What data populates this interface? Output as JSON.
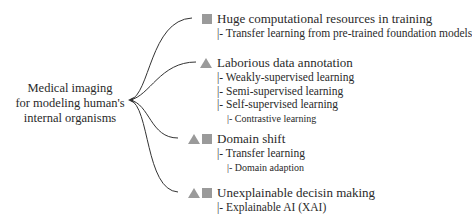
{
  "root": {
    "lines": [
      "Medical imaging",
      "for modeling human's",
      "internal organisms"
    ]
  },
  "legend_icons": {
    "square": "gray-square-icon",
    "triangle": "gray-triangle-icon",
    "color": "#9a9a9a"
  },
  "branches": [
    {
      "title": "Huge computational resources in training",
      "icons": [
        "square"
      ],
      "children": [
        {
          "text": "|- Transfer learning from pre-trained foundation models",
          "level": 1
        }
      ]
    },
    {
      "title": "Laborious data annotation",
      "icons": [
        "triangle"
      ],
      "children": [
        {
          "text": "|- Weakly-supervised learning",
          "level": 1
        },
        {
          "text": "|- Semi-supervised learning",
          "level": 1
        },
        {
          "text": "|- Self-supervised learning",
          "level": 1
        },
        {
          "text": "|- Contrastive learning",
          "level": 2
        }
      ]
    },
    {
      "title": "Domain shift",
      "icons": [
        "triangle",
        "square"
      ],
      "children": [
        {
          "text": "|- Transfer learning",
          "level": 1
        },
        {
          "text": "|- Domain adaption",
          "level": 2
        }
      ]
    },
    {
      "title": "Unexplainable decisin making",
      "icons": [
        "triangle",
        "square"
      ],
      "children": [
        {
          "text": "|- Explainable AI (XAI)",
          "level": 1
        }
      ]
    }
  ]
}
